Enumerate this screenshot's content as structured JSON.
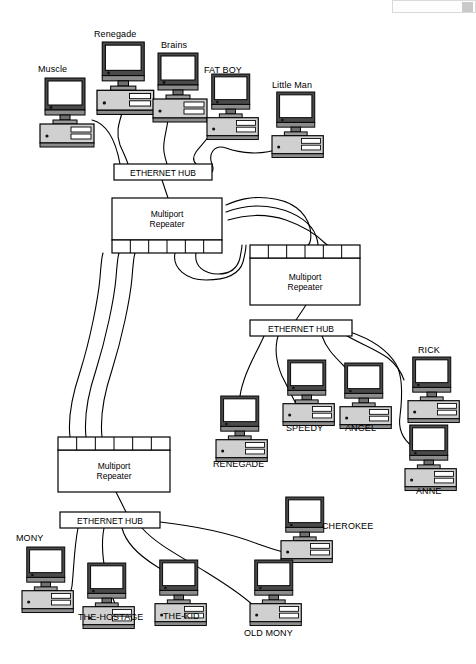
{
  "diagram": {
    "type": "network-topology",
    "device_labels": {
      "hub": "ETHERNET HUB",
      "repeater_line1": "Multiport",
      "repeater_line2": "Repeater"
    },
    "hubs": [
      {
        "id": "hub-top",
        "label": "ETHERNET HUB",
        "x": 114,
        "y": 164,
        "w": 98,
        "h": 16
      },
      {
        "id": "hub-middle",
        "label": "ETHERNET HUB",
        "x": 250,
        "y": 320,
        "w": 102,
        "h": 16
      },
      {
        "id": "hub-bottom",
        "label": "ETHERNET HUB",
        "x": 60,
        "y": 512,
        "w": 100,
        "h": 16
      }
    ],
    "repeaters": [
      {
        "id": "repeater-top",
        "label_line1": "Multiport",
        "label_line2": "Repeater",
        "x": 112,
        "y": 198,
        "w": 110,
        "h": 55,
        "ports": "bottom",
        "port_count": 6
      },
      {
        "id": "repeater-middle",
        "label_line1": "Multiport",
        "label_line2": "Repeater",
        "x": 250,
        "y": 245,
        "w": 110,
        "h": 60,
        "ports": "top",
        "port_count": 6
      },
      {
        "id": "repeater-bottom",
        "label_line1": "Multiport",
        "label_line2": "Repeater",
        "x": 58,
        "y": 437,
        "w": 112,
        "h": 55,
        "ports": "top",
        "port_count": 6
      }
    ],
    "computers": [
      {
        "id": "muscle",
        "label": "Muscle",
        "x": 40,
        "y": 78,
        "label_x": 38,
        "label_y": 64,
        "scale": 1.0
      },
      {
        "id": "renegade-top",
        "label": "Renegade",
        "x": 97,
        "y": 42,
        "label_x": 94,
        "label_y": 29,
        "scale": 1.05
      },
      {
        "id": "brains",
        "label": "Brains",
        "x": 153,
        "y": 53,
        "label_x": 161,
        "label_y": 40,
        "scale": 1.0
      },
      {
        "id": "fat-boy",
        "label": "FAT BOY",
        "x": 207,
        "y": 74,
        "label_x": 204,
        "label_y": 65,
        "scale": 0.95
      },
      {
        "id": "little-man",
        "label": "Little Man",
        "x": 272,
        "y": 92,
        "label_x": 272,
        "label_y": 80,
        "scale": 0.95
      },
      {
        "id": "renegade-2",
        "label": "RENEGADE",
        "x": 216,
        "y": 396,
        "label_x": 213,
        "label_y": 459,
        "scale": 0.95
      },
      {
        "id": "speedy",
        "label": "SPEEDY",
        "x": 283,
        "y": 360,
        "label_x": 286,
        "label_y": 423,
        "scale": 0.95
      },
      {
        "id": "angel",
        "label": "ANGEL",
        "x": 340,
        "y": 363,
        "label_x": 345,
        "label_y": 423,
        "scale": 0.95
      },
      {
        "id": "rick",
        "label": "RICK",
        "x": 408,
        "y": 357,
        "label_x": 418,
        "label_y": 345,
        "scale": 0.95
      },
      {
        "id": "anne",
        "label": "ANNE",
        "x": 405,
        "y": 425,
        "label_x": 416,
        "label_y": 486,
        "scale": 0.95
      },
      {
        "id": "cherokee",
        "label": "CHEROKEE",
        "x": 281,
        "y": 497,
        "label_x": 322,
        "label_y": 521,
        "scale": 0.95
      },
      {
        "id": "mony",
        "label": "MONY",
        "x": 22,
        "y": 547,
        "label_x": 16,
        "label_y": 533,
        "scale": 0.95
      },
      {
        "id": "the-hostage",
        "label": "THE-HOSTAGE",
        "x": 83,
        "y": 563,
        "label_x": 78,
        "label_y": 612,
        "scale": 0.95
      },
      {
        "id": "the-kid",
        "label": "THE-KID",
        "x": 155,
        "y": 560,
        "label_x": 163,
        "label_y": 611,
        "scale": 0.95
      },
      {
        "id": "old-mony",
        "label": "OLD MONY",
        "x": 250,
        "y": 560,
        "label_x": 244,
        "label_y": 628,
        "scale": 0.95
      }
    ],
    "links": [
      {
        "from": "muscle",
        "to": "hub-top",
        "path": "M 92 120 C 108 124 116 142 120 164"
      },
      {
        "from": "renegade-top",
        "to": "hub-top",
        "path": "M 126 98 C 122 118 114 128 120 145 C 124 154 126 158 128 164"
      },
      {
        "from": "brains",
        "to": "hub-top",
        "path": "M 169 110 C 168 130 162 140 164 152 C 165 158 166 161 167 164"
      },
      {
        "from": "fat-boy",
        "to": "hub-top",
        "path": "M 212 131 C 206 142 200 146 196 152 C 192 158 194 162 196 164"
      },
      {
        "from": "little-man",
        "to": "hub-top",
        "path": "M 280 148 C 262 156 240 153 226 148 C 214 144 208 154 212 164 C 214 170 212 172 212 172"
      },
      {
        "from": "hub-top",
        "to": "repeater-top",
        "path": "M 162 180 L 168 198"
      },
      {
        "from": "repeater-top",
        "to": "repeater-middle",
        "path": "M 226 205 C 238 200 250 196 268 198 C 292 200 306 212 310 228 C 312 238 310 244 308 245"
      },
      {
        "from": "repeater-top",
        "to": "repeater-middle",
        "path": "M 226 212 C 242 206 258 204 276 208 C 298 213 312 224 316 236 C 318 242 318 244 318 245"
      },
      {
        "from": "repeater-top",
        "to": "repeater-middle",
        "path": "M 228 220 C 248 214 268 214 286 220 C 306 227 320 238 326 244 C 328 246 328 245 328 245"
      },
      {
        "from": "repeater-top-port",
        "to": "repeater-middle",
        "path": "M 175 253 C 172 268 186 280 206 280 C 230 280 240 272 243 262 C 245 254 246 248 246 245"
      },
      {
        "from": "repeater-top-port",
        "to": "repeater-middle",
        "path": "M 196 253 C 194 266 204 274 218 274 C 232 274 238 266 240 258 C 241 252 242 248 242 245"
      },
      {
        "from": "repeater-middle",
        "to": "hub-middle",
        "path": "M 306 305 L 296 320"
      },
      {
        "from": "hub-middle",
        "to": "renegade-2",
        "path": "M 264 336 C 258 350 250 362 244 380 C 240 392 240 396 240 398"
      },
      {
        "from": "hub-middle",
        "to": "speedy",
        "path": "M 278 336 C 274 350 276 362 282 376 C 288 388 292 396 296 404"
      },
      {
        "from": "hub-middle",
        "to": "angel",
        "path": "M 322 336 C 326 348 334 356 344 366 C 352 374 356 380 358 386"
      },
      {
        "from": "hub-middle",
        "to": "rick",
        "path": "M 344 334 C 356 342 374 348 388 358 C 398 366 402 374 404 380"
      },
      {
        "from": "hub-middle",
        "to": "anne",
        "path": "M 350 332 C 368 338 386 348 396 364 C 404 378 402 400 400 416 C 398 430 404 440 412 446"
      },
      {
        "from": "repeater-bottom",
        "to": "hub-bottom",
        "path": "M 116 492 L 126 512"
      },
      {
        "from": "hub-bottom",
        "to": "mony",
        "path": "M 78 528 C 74 548 74 568 72 586 C 70 600 58 608 48 604 C 40 601 40 596 40 592"
      },
      {
        "from": "hub-bottom",
        "to": "the-hostage",
        "path": "M 104 528 C 100 548 104 568 108 584 C 112 596 114 602 116 606"
      },
      {
        "from": "hub-bottom",
        "to": "the-kid",
        "path": "M 122 528 C 126 544 140 556 156 566 C 170 574 178 582 182 590"
      },
      {
        "from": "hub-bottom",
        "to": "old-mony",
        "path": "M 142 528 C 156 544 180 556 206 572 C 232 588 248 600 256 608"
      },
      {
        "from": "hub-bottom",
        "to": "cherokee",
        "path": "M 160 522 C 196 526 232 534 258 544 C 278 551 290 554 298 555"
      },
      {
        "from": "repeater-bottom-port",
        "to": "repeater-top-port",
        "path": "M 70 437 C 68 420 72 396 80 372 C 90 340 98 300 100 278 C 101 264 102 256 103 253"
      },
      {
        "from": "repeater-bottom-port",
        "to": "repeater-top-port",
        "path": "M 86 437 C 84 418 88 394 96 370 C 106 338 114 300 116 278 C 117 264 118 256 119 253"
      },
      {
        "from": "repeater-bottom-port",
        "to": "repeater-top-port",
        "path": "M 102 437 C 100 418 104 394 112 370 C 122 338 130 300 132 278 C 133 264 134 256 135 253"
      }
    ]
  },
  "viewer_chrome": {
    "toolbar_fragment": "",
    "visible": true
  }
}
